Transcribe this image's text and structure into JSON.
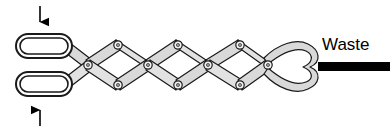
{
  "figure": {
    "type": "schematic-diagram",
    "background_color": "#ffffff",
    "labels": {
      "waste": "Waste"
    },
    "colors": {
      "link_fill": "#d9d9d9",
      "link_fill_light": "#e8e8e8",
      "outline": "#1a1a1a",
      "waste_bar": "#000000",
      "arrow": "#000000",
      "joint_fill": "#f2f2f2"
    },
    "inlet_chambers": [
      {
        "name": "upper-chamber",
        "cx": 44,
        "cy": 46,
        "rx": 28,
        "ry": 12
      },
      {
        "name": "lower-chamber",
        "cx": 44,
        "cy": 84,
        "rx": 28,
        "ry": 12
      }
    ],
    "arrows": [
      {
        "name": "top-inlet-arrow",
        "direction": "down",
        "x": 40,
        "y_start": 6,
        "y_end": 33
      },
      {
        "name": "bottom-inlet-arrow",
        "direction": "up",
        "x": 40,
        "y_start": 126,
        "y_end": 97
      }
    ],
    "lattice": {
      "top_joints_x": [
        118,
        178,
        240
      ],
      "bottom_joints_x": [
        118,
        178,
        240
      ],
      "mid_joints_x": [
        88,
        148,
        208,
        268
      ],
      "top_y": 45,
      "mid_y": 65,
      "bottom_y": 85,
      "joint_count": 10
    },
    "outlet": {
      "name": "waste-outlet",
      "bar_x": 318,
      "bar_y": 62,
      "bar_width": 72,
      "bar_height": 9,
      "label_x": 322,
      "label_y": 48
    }
  }
}
